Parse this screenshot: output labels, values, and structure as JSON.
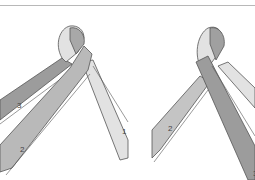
{
  "figure": {
    "colors": {
      "rule": "#b8b8b8",
      "outline": "#555555",
      "strand_dark": "#9c9c9c",
      "strand_medium": "#b9b9b9",
      "strand_light": "#e2e2e2"
    },
    "panels": [
      {
        "name": "left",
        "labels": [
          {
            "text": "3",
            "x": 17,
            "y": 108
          },
          {
            "text": "2",
            "x": 20,
            "y": 152
          },
          {
            "text": "1",
            "x": 122,
            "y": 134
          }
        ]
      },
      {
        "name": "right",
        "labels": [
          {
            "text": "2",
            "x": 168,
            "y": 131
          },
          {
            "text": "3",
            "x": 253,
            "y": 176
          }
        ]
      }
    ]
  }
}
